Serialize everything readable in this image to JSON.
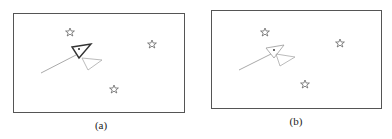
{
  "figure": {
    "panels": [
      {
        "id": "a",
        "caption": "(a)",
        "stars": 3,
        "has_bold_triangle": true
      },
      {
        "id": "b",
        "caption": "(b)",
        "stars": 3,
        "has_bold_triangle": false
      }
    ],
    "colors": {
      "frame": "#555555",
      "star": "#666666",
      "line": "#999999",
      "background": "#ffffff"
    }
  }
}
